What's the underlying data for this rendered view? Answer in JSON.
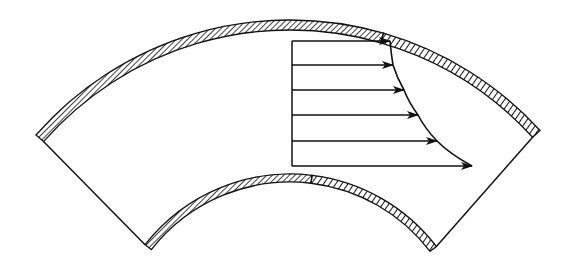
{
  "diagram": {
    "colors": {
      "line": "#111111",
      "background": "#ffffff"
    },
    "geometry": {
      "center": [
        290,
        358
      ],
      "outer_wall": {
        "r_outer": 338,
        "r_inner": 328
      },
      "inner_wall": {
        "r_outer": 184,
        "r_inner": 176
      },
      "left_end": {
        "outer": [
          36,
          135
        ],
        "inner": [
          148,
          247
        ]
      },
      "right_end": {
        "outer": [
          545,
          126
        ],
        "inner": [
          441,
          243
        ]
      }
    },
    "velocity_profile": {
      "base_x": 292,
      "arrows": [
        {
          "y": 41,
          "tip_x": 390
        },
        {
          "y": 65,
          "tip_x": 393
        },
        {
          "y": 90,
          "tip_x": 404
        },
        {
          "y": 115,
          "tip_x": 418
        },
        {
          "y": 141,
          "tip_x": 437
        },
        {
          "y": 166,
          "tip_x": 472
        }
      ]
    }
  }
}
